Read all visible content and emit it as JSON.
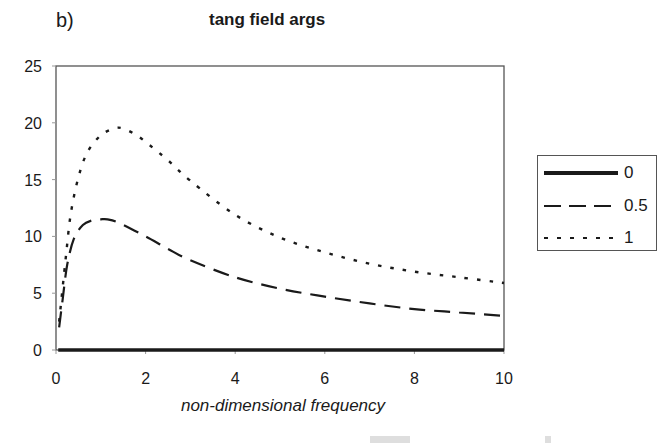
{
  "panel_label": "b)",
  "chart_data": {
    "type": "line",
    "title": "tang field args",
    "xlabel": "non-dimensional frequency",
    "ylabel": "",
    "xlim": [
      0,
      10
    ],
    "ylim": [
      0,
      25
    ],
    "x_ticks": [
      "0",
      "2",
      "4",
      "6",
      "8",
      "10"
    ],
    "y_ticks": [
      "0",
      "5",
      "10",
      "15",
      "20",
      "25"
    ],
    "grid": false,
    "legend_position": "right",
    "series": [
      {
        "name": "0",
        "style": "solid-thick",
        "x": [
          0.05,
          1,
          2,
          3,
          4,
          5,
          6,
          7,
          8,
          9,
          10
        ],
        "y": [
          0,
          0,
          0,
          0,
          0,
          0,
          0,
          0,
          0,
          0,
          0
        ]
      },
      {
        "name": "0.5",
        "style": "long-dash",
        "x": [
          0.07,
          0.15,
          0.25,
          0.4,
          0.6,
          0.8,
          1.0,
          1.15,
          1.4,
          2.0,
          2.5,
          3.0,
          4.0,
          5.0,
          6.0,
          7.0,
          8.0,
          9.0,
          10.0
        ],
        "y": [
          2.0,
          4.5,
          7.5,
          9.8,
          11.0,
          11.4,
          11.5,
          11.5,
          11.2,
          10.0,
          8.9,
          7.9,
          6.4,
          5.4,
          4.7,
          4.1,
          3.6,
          3.3,
          3.0
        ]
      },
      {
        "name": "1",
        "style": "dotted",
        "x": [
          0.07,
          0.12,
          0.22,
          0.33,
          0.5,
          0.7,
          1.0,
          1.3,
          1.5,
          1.8,
          2.1,
          2.5,
          3.0,
          4.0,
          5.0,
          6.0,
          7.0,
          8.0,
          9.0,
          10.0
        ],
        "y": [
          2.5,
          4.4,
          8.2,
          12.0,
          15.2,
          17.4,
          18.9,
          19.5,
          19.5,
          18.9,
          18.0,
          16.7,
          14.9,
          11.9,
          9.9,
          8.6,
          7.6,
          6.9,
          6.4,
          5.9
        ]
      }
    ]
  }
}
